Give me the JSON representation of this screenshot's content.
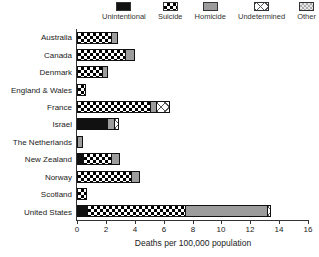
{
  "chart_data": {
    "type": "bar",
    "orientation": "horizontal",
    "stacked": true,
    "title": "",
    "xlabel": "Deaths per 100,000 population",
    "ylabel": "",
    "xlim": [
      0,
      16
    ],
    "xticks": [
      0,
      2,
      4,
      6,
      8,
      10,
      12,
      14,
      16
    ],
    "grid": false,
    "legend_position": "top",
    "legend": [
      {
        "key": "unintentional",
        "label": "Unintentional"
      },
      {
        "key": "suicide",
        "label": "Suicide"
      },
      {
        "key": "homicide",
        "label": "Homicide"
      },
      {
        "key": "undetermined",
        "label": "Undetermined"
      },
      {
        "key": "other",
        "label": "Other"
      }
    ],
    "rows": [
      {
        "country": "Australia",
        "segments": [
          {
            "key": "suicide",
            "value": 2.3
          },
          {
            "key": "homicide",
            "value": 0.45
          }
        ]
      },
      {
        "country": "Canada",
        "segments": [
          {
            "key": "suicide",
            "value": 3.25
          },
          {
            "key": "homicide",
            "value": 0.6
          }
        ]
      },
      {
        "country": "Denmark",
        "segments": [
          {
            "key": "suicide",
            "value": 1.65
          },
          {
            "key": "homicide",
            "value": 0.35
          }
        ]
      },
      {
        "country": "England & Wales",
        "segments": [
          {
            "key": "suicide",
            "value": 0.5
          }
        ]
      },
      {
        "country": "France",
        "segments": [
          {
            "key": "suicide",
            "value": 5.0
          },
          {
            "key": "homicide",
            "value": 0.45
          },
          {
            "key": "undetermined",
            "value": 0.9
          }
        ]
      },
      {
        "country": "Israel",
        "segments": [
          {
            "key": "unintentional",
            "value": 2.0
          },
          {
            "key": "homicide",
            "value": 0.5
          },
          {
            "key": "undetermined",
            "value": 0.3
          }
        ]
      },
      {
        "country": "The Netherlands",
        "segments": [
          {
            "key": "homicide",
            "value": 0.3
          }
        ]
      },
      {
        "country": "New Zealand",
        "segments": [
          {
            "key": "unintentional",
            "value": 0.35
          },
          {
            "key": "suicide",
            "value": 1.95
          },
          {
            "key": "homicide",
            "value": 0.55
          }
        ]
      },
      {
        "country": "Norway",
        "segments": [
          {
            "key": "suicide",
            "value": 3.7
          },
          {
            "key": "homicide",
            "value": 0.55
          }
        ]
      },
      {
        "country": "Scotland",
        "segments": [
          {
            "key": "suicide",
            "value": 0.55
          }
        ]
      },
      {
        "country": "United States",
        "segments": [
          {
            "key": "unintentional",
            "value": 0.6
          },
          {
            "key": "suicide",
            "value": 6.8
          },
          {
            "key": "homicide",
            "value": 5.7
          },
          {
            "key": "undetermined",
            "value": 0.2
          }
        ]
      }
    ]
  },
  "colors": {
    "unintentional": "#111111",
    "homicide": "#9c9c9c",
    "other_base": "#e8e8e8",
    "axis": "#333333",
    "text": "#222222"
  }
}
